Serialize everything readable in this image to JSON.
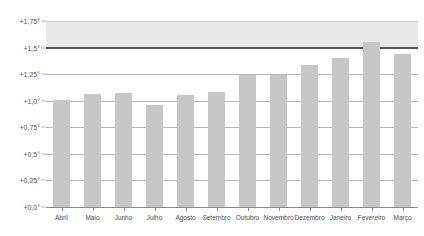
{
  "chart_data": {
    "type": "bar",
    "title": "",
    "subtitle": "",
    "xlabel": "",
    "ylabel": "",
    "categories": [
      "Abril",
      "Maio",
      "Junho",
      "Julho",
      "Agosto",
      "Setembro",
      "Outubro",
      "Novembro",
      "Dezembro",
      "Janeiro",
      "Fevereiro",
      "Março"
    ],
    "values": [
      1.01,
      1.06,
      1.07,
      0.96,
      1.05,
      1.08,
      1.24,
      1.24,
      1.34,
      1.4,
      1.55,
      1.44
    ],
    "series": [
      {
        "name": "",
        "values": [
          1.01,
          1.06,
          1.07,
          0.96,
          1.05,
          1.08,
          1.24,
          1.24,
          1.34,
          1.4,
          1.55,
          1.44
        ]
      }
    ],
    "ylim": [
      0.0,
      1.75
    ],
    "ytick_values": [
      0.0,
      0.25,
      0.5,
      0.75,
      1.0,
      1.25,
      1.5,
      1.75
    ],
    "ytick_labels": [
      "+0,0°",
      "+0,25°",
      "+0,5°",
      "+0,75°",
      "+1,0°",
      "+1,25°",
      "+1,5°",
      "+1,75°"
    ],
    "grid": true,
    "legend": null,
    "legend_position": "none",
    "annotations": {
      "shaded_band": {
        "from": 1.5,
        "to": 1.75,
        "color": "#e8e8e8"
      },
      "threshold_line": {
        "value": 1.5,
        "color": "#555555"
      }
    },
    "colors": {
      "bar": "#c6c6c6",
      "gridline": "#b4b4b4",
      "threshold": "#555555",
      "band": "#e8e8e8",
      "text": "#4d4d4d",
      "background": "#ffffff"
    }
  }
}
